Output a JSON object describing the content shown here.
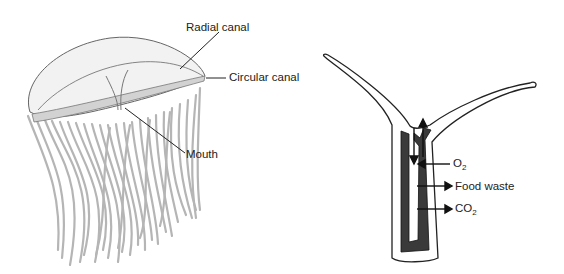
{
  "figure": {
    "left_panel": {
      "subject": "jellyfish",
      "labels": {
        "radial_canal": "Radial canal",
        "circular_canal": "Circular canal",
        "mouth": "Mouth"
      }
    },
    "right_panel": {
      "subject": "hydra-like body cross section",
      "labels": {
        "o2": "O",
        "o2_sub": "2",
        "food_waste": "Food waste",
        "co2": "CO",
        "co2_sub": "2"
      }
    }
  },
  "colors": {
    "outline": "#555555",
    "tentacle": "#b5b5b5",
    "bell_fill": "#f2f2f2",
    "canal_band": "#cfcfcf",
    "dark_tissue": "#3a3a3a",
    "text": "#222222"
  }
}
